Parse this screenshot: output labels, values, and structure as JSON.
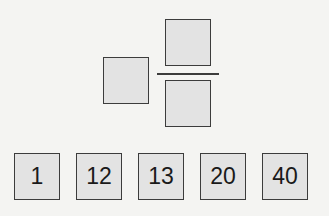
{
  "exercise": {
    "type": "mixed-number-fraction-builder",
    "targets": {
      "whole": "",
      "numerator": "",
      "denominator": ""
    },
    "tiles": [
      {
        "label": "1"
      },
      {
        "label": "12"
      },
      {
        "label": "13"
      },
      {
        "label": "20"
      },
      {
        "label": "40"
      }
    ]
  },
  "colors": {
    "background": "#f4f4f2",
    "box_fill": "#e3e3e3",
    "box_border": "#3c3c3c",
    "text": "#1a1a1a"
  }
}
